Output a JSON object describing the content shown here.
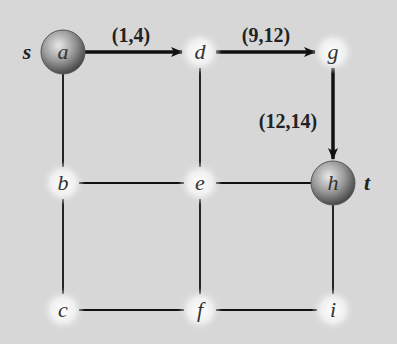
{
  "colors": {
    "background": "#d7d7d7",
    "edge": "#111111",
    "terminal_node": "#8a8a8a",
    "plain_node_glow": "#ffffff"
  },
  "nodes": [
    {
      "id": "a",
      "label": "a",
      "x": 63,
      "y": 52,
      "terminal": true
    },
    {
      "id": "d",
      "label": "d",
      "x": 200,
      "y": 52,
      "terminal": false
    },
    {
      "id": "g",
      "label": "g",
      "x": 333,
      "y": 52,
      "terminal": false
    },
    {
      "id": "b",
      "label": "b",
      "x": 63,
      "y": 183,
      "terminal": false
    },
    {
      "id": "e",
      "label": "e",
      "x": 200,
      "y": 183,
      "terminal": false
    },
    {
      "id": "h",
      "label": "h",
      "x": 333,
      "y": 183,
      "terminal": true
    },
    {
      "id": "c",
      "label": "c",
      "x": 63,
      "y": 310,
      "terminal": false
    },
    {
      "id": "f",
      "label": "f",
      "x": 200,
      "y": 310,
      "terminal": false
    },
    {
      "id": "i",
      "label": "i",
      "x": 333,
      "y": 310,
      "terminal": false
    }
  ],
  "side_labels": [
    {
      "text": "s",
      "x": 27,
      "y": 59
    },
    {
      "text": "t",
      "x": 367,
      "y": 190
    }
  ],
  "edges": [
    {
      "from": "a",
      "to": "d",
      "directed": true,
      "label": "(1,4)"
    },
    {
      "from": "d",
      "to": "g",
      "directed": true,
      "label": "(9,12)"
    },
    {
      "from": "g",
      "to": "h",
      "directed": true,
      "label": "(12,14)"
    },
    {
      "from": "a",
      "to": "b",
      "directed": false
    },
    {
      "from": "b",
      "to": "c",
      "directed": false
    },
    {
      "from": "d",
      "to": "e",
      "directed": false
    },
    {
      "from": "e",
      "to": "f",
      "directed": false
    },
    {
      "from": "b",
      "to": "e",
      "directed": false
    },
    {
      "from": "e",
      "to": "h",
      "directed": false
    },
    {
      "from": "c",
      "to": "f",
      "directed": false
    },
    {
      "from": "f",
      "to": "i",
      "directed": false
    },
    {
      "from": "h",
      "to": "i",
      "directed": false
    }
  ],
  "edge_labels": [
    {
      "text": "(1,4)",
      "x": 131,
      "y": 42
    },
    {
      "text": "(9,12)",
      "x": 266,
      "y": 42
    },
    {
      "text": "(12,14)",
      "x": 288,
      "y": 128
    }
  ]
}
